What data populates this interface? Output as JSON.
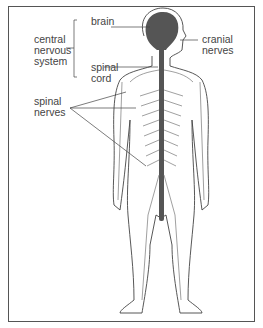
{
  "diagram": {
    "labels": {
      "brain": "brain",
      "cns_line1": "central",
      "cns_line2": "nervous",
      "cns_line3": "system",
      "spinal_cord_line1": "spinal",
      "spinal_cord_line2": "cord",
      "cranial_line1": "cranial",
      "cranial_line2": "nerves",
      "spinal_nerves_line1": "spinal",
      "spinal_nerves_line2": "nerves"
    },
    "colors": {
      "nerve_fill": "#555555",
      "outline": "#444444",
      "background": "#ffffff"
    }
  }
}
